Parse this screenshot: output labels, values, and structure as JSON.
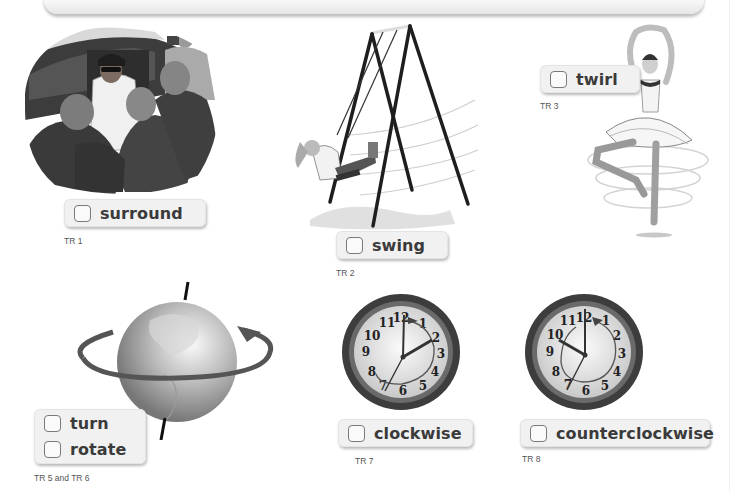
{
  "page": {
    "vocab_cards": [
      {
        "id": "surround",
        "word": "surround",
        "track": "TR 1",
        "image": "crowd-surrounding-person-at-car"
      },
      {
        "id": "swing",
        "word": "swing",
        "track": "TR 2",
        "image": "girl-on-swing-set"
      },
      {
        "id": "twirl",
        "word": "twirl",
        "track": "TR 3",
        "image": "ballerina-twirling"
      },
      {
        "id": "turn-rotate",
        "words": [
          "turn",
          "rotate"
        ],
        "track": "TR 5 and TR 6",
        "image": "globe-rotating-on-axis"
      },
      {
        "id": "clockwise",
        "word": "clockwise",
        "track": "TR 7",
        "image": "clock-clockwise-arrow",
        "clock": {
          "numerals": [
            "12",
            "1",
            "2",
            "3",
            "4",
            "5",
            "6",
            "7",
            "8",
            "9",
            "10",
            "11"
          ],
          "hour_hand_to": "2",
          "minute_hand_to": "7"
        }
      },
      {
        "id": "counterclockwise",
        "word": "counterclockwise",
        "track": "TR 8",
        "image": "clock-counterclockwise-arrow",
        "clock": {
          "numerals": [
            "12",
            "1",
            "2",
            "3",
            "4",
            "5",
            "6",
            "7",
            "8",
            "9",
            "10",
            "11"
          ],
          "hour_hand_to": "10",
          "minute_hand_to": "7"
        }
      }
    ]
  },
  "colors": {
    "label_bg": "#f1f1f1",
    "text": "#3a3a3a",
    "checkbox_border": "#7a7a7a"
  }
}
